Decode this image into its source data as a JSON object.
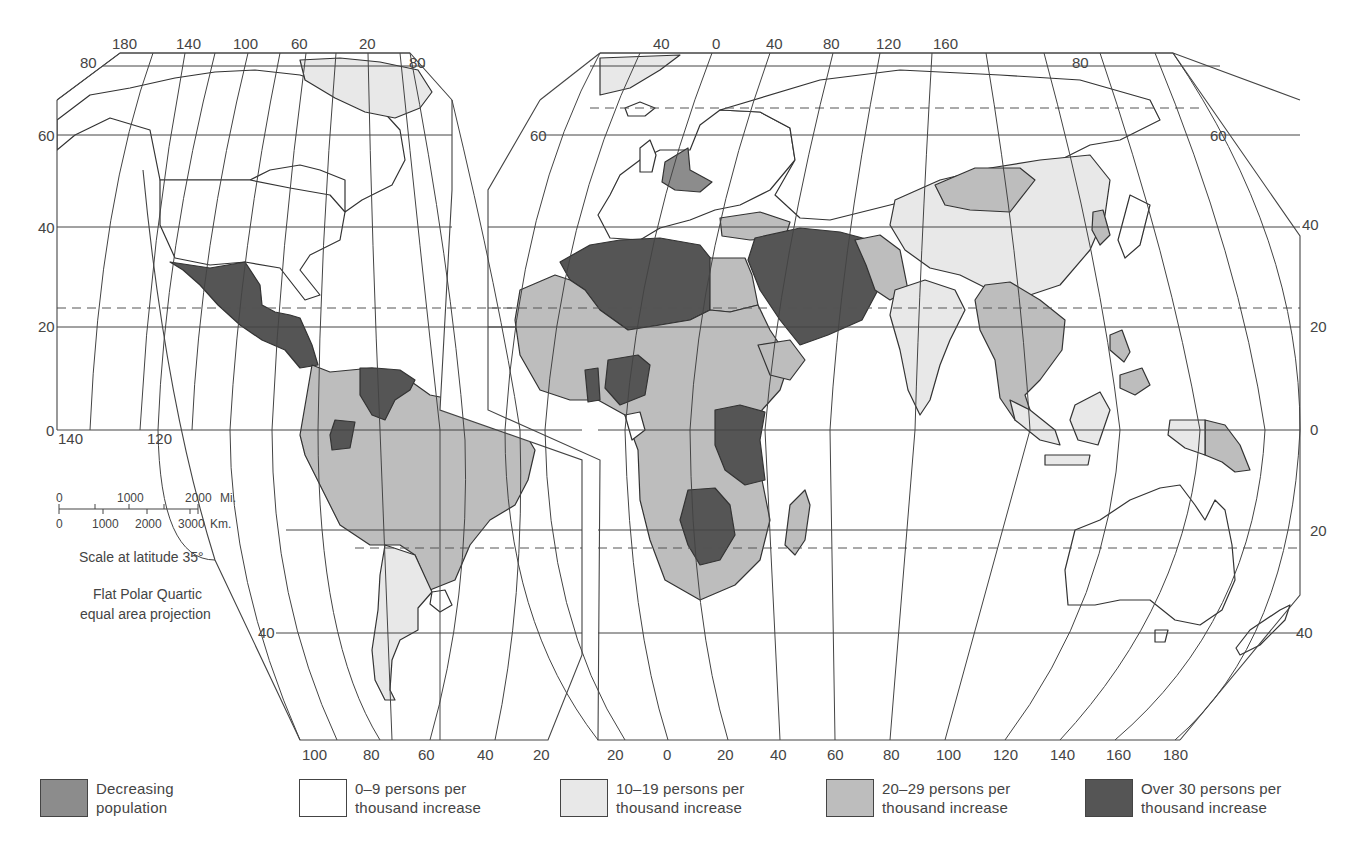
{
  "map": {
    "projection_note_line1": "Flat Polar Quartic",
    "projection_note_line2": "equal area projection",
    "scale": {
      "title": "Scale at latitude 35°",
      "miles_ticks": [
        "0",
        "1000",
        "2000"
      ],
      "miles_unit": "Mi.",
      "km_ticks": [
        "0",
        "1000",
        "2000",
        "3000"
      ],
      "km_unit": "Km."
    },
    "colors": {
      "decreasing": "#8c8c8c",
      "low": "#ffffff",
      "lowmid": "#e8e8e8",
      "mid": "#bdbdbd",
      "high": "#555555",
      "line": "#444444"
    },
    "west_lobe": {
      "top_longitudes": [
        "180",
        "140",
        "100",
        "60",
        "20"
      ],
      "bottom_longitudes": [
        "100",
        "80",
        "60",
        "40",
        "20"
      ],
      "left_latitudes": [
        "80",
        "60",
        "40",
        "20",
        "0"
      ],
      "right_top_latitude": "80",
      "inner_longitudes": [
        "140",
        "120"
      ],
      "south_latitude": "40"
    },
    "east_lobe": {
      "top_longitudes": [
        "40",
        "0",
        "40",
        "80",
        "120",
        "160"
      ],
      "bottom_longitudes": [
        "20",
        "0",
        "20",
        "40",
        "60",
        "80",
        "100",
        "120",
        "140",
        "160",
        "180"
      ],
      "left_latitude": "60",
      "right_latitudes": [
        "80",
        "60",
        "40",
        "20",
        "0",
        "20",
        "40"
      ]
    },
    "regions": [
      {
        "name": "Canada",
        "category": "low"
      },
      {
        "name": "United States",
        "category": "low"
      },
      {
        "name": "Greenland",
        "category": "lowmid"
      },
      {
        "name": "Mexico & Central America",
        "category": "high"
      },
      {
        "name": "Venezuela",
        "category": "high"
      },
      {
        "name": "Ecuador",
        "category": "high"
      },
      {
        "name": "Brazil & northern South America",
        "category": "mid"
      },
      {
        "name": "Argentina & Chile",
        "category": "lowmid"
      },
      {
        "name": "Uruguay",
        "category": "low"
      },
      {
        "name": "Europe",
        "category": "low"
      },
      {
        "name": "Central Europe (Germany, Austria, Hungary)",
        "category": "decreasing"
      },
      {
        "name": "USSR",
        "category": "low"
      },
      {
        "name": "Turkey",
        "category": "mid"
      },
      {
        "name": "North Africa (Morocco, Algeria, Libya)",
        "category": "high"
      },
      {
        "name": "Sub-Saharan Africa",
        "category": "mid"
      },
      {
        "name": "Nigeria, Ghana",
        "category": "high"
      },
      {
        "name": "East Africa (Kenya, Uganda, Tanzania)",
        "category": "high"
      },
      {
        "name": "Zambia, Zimbabwe, Botswana",
        "category": "high"
      },
      {
        "name": "Middle East (Iraq, Iran, Saudi Arabia, Syria)",
        "category": "high"
      },
      {
        "name": "China",
        "category": "lowmid"
      },
      {
        "name": "India",
        "category": "lowmid"
      },
      {
        "name": "Mongolia",
        "category": "mid"
      },
      {
        "name": "South-east Asia",
        "category": "mid"
      },
      {
        "name": "Indonesia",
        "category": "lowmid"
      },
      {
        "name": "Papua New Guinea",
        "category": "mid"
      },
      {
        "name": "Australia",
        "category": "low"
      },
      {
        "name": "New Zealand",
        "category": "low"
      },
      {
        "name": "Japan",
        "category": "low"
      }
    ]
  },
  "legend": [
    {
      "key": "decreasing",
      "label": "Decreasing\npopulation",
      "color": "#8c8c8c"
    },
    {
      "key": "low",
      "label": "0–9 persons per\nthousand increase",
      "color": "#ffffff"
    },
    {
      "key": "lowmid",
      "label": "10–19 persons per\nthousand increase",
      "color": "#e8e8e8"
    },
    {
      "key": "mid",
      "label": "20–29 persons per\nthousand increase",
      "color": "#bdbdbd"
    },
    {
      "key": "high",
      "label": "Over 30 persons per\nthousand increase",
      "color": "#555555"
    }
  ]
}
